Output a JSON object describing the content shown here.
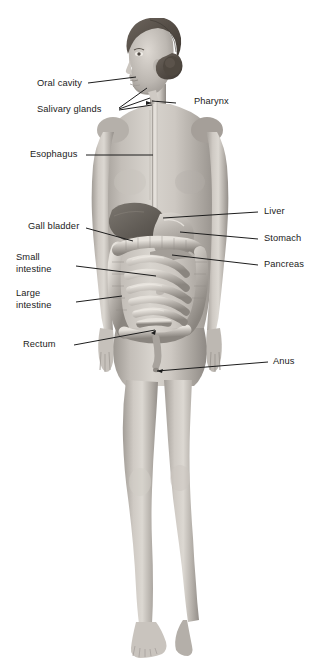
{
  "figure": {
    "background_color": "#ffffff",
    "skin_color": "#b9b4ae",
    "organ_color": "#8f8b86",
    "leader_line_color": "#1d1d1d",
    "label_color": "#1b1b1b",
    "width": 319,
    "height": 665
  },
  "labels": {
    "oral_cavity": "Oral cavity",
    "salivary_glands": "Salivary glands",
    "esophagus": "Esophagus",
    "gall_bladder": "Gall bladder",
    "small_intestine": "Small\nintestine",
    "large_intestine": "Large\nintestine",
    "rectum": "Rectum",
    "pharynx": "Pharynx",
    "liver": "Liver",
    "stomach": "Stomach",
    "pancreas": "Pancreas",
    "anus": "Anus"
  }
}
